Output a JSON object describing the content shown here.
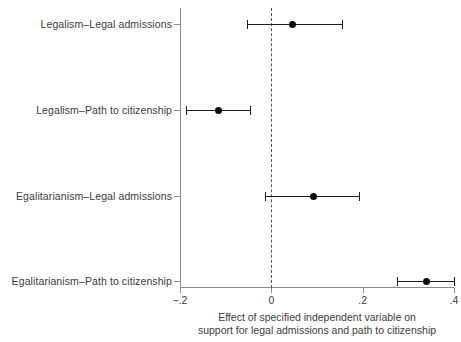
{
  "chart_data": {
    "type": "scatter",
    "subtype": "coefficient-plot",
    "title": "",
    "xlabel": "Effect of specified independent variable on support for legal admissions and path to citizenship",
    "xlabel_lines": [
      "Effect of specified independent variable on",
      "support for legal admissions and path to citizenship"
    ],
    "ylabel": "",
    "categories": [
      "Legalism–Legal admissions",
      "Legalism–Path to citizenship",
      "Egalitarianism–Legal admissions",
      "Egalitarianism–Path to citizenship"
    ],
    "values": [
      0.047,
      -0.115,
      0.092,
      0.339
    ],
    "ci_low": [
      -0.054,
      -0.186,
      -0.014,
      0.275
    ],
    "ci_high": [
      0.155,
      -0.047,
      0.191,
      0.4
    ],
    "points": [
      {
        "label": "Legalism–Legal admissions",
        "estimate": 0.047,
        "ci_low": -0.054,
        "ci_high": 0.155,
        "significant": false
      },
      {
        "label": "Legalism–Path to citizenship",
        "estimate": -0.115,
        "ci_low": -0.186,
        "ci_high": -0.047,
        "significant": true
      },
      {
        "label": "Egalitarianism–Legal admissions",
        "estimate": 0.092,
        "ci_low": -0.014,
        "ci_high": 0.191,
        "significant": false
      },
      {
        "label": "Egalitarianism–Path to citizenship",
        "estimate": 0.339,
        "ci_low": 0.275,
        "ci_high": 0.4,
        "significant": true
      }
    ],
    "xlim": [
      -0.2,
      0.4
    ],
    "xticks": [
      -0.2,
      0,
      0.2,
      0.4
    ],
    "xtick_labels": [
      "−.2",
      "0",
      ".2",
      ".4"
    ],
    "reference_line": {
      "value": 0,
      "style": "dashed"
    },
    "grid": false,
    "legend": null,
    "colors": {
      "point": "#0d0d0d",
      "interval": "#1c1c1c",
      "axis": "#8c8c8c",
      "reference_line": "#555555",
      "text": "#3d3d3d",
      "background": "#ffffff"
    }
  },
  "axis": {
    "x_tick_labels": [
      "−.2",
      "0",
      ".2",
      ".4"
    ],
    "caption_line_1": "Effect of specified independent variable on",
    "caption_line_2": "support for legal admissions and path to citizenship"
  },
  "rows": [
    {
      "label": "Legalism–Legal admissions"
    },
    {
      "label": "Legalism–Path to citizenship"
    },
    {
      "label": "Egalitarianism–Legal admissions"
    },
    {
      "label": "Egalitarianism–Path to citizenship"
    }
  ]
}
